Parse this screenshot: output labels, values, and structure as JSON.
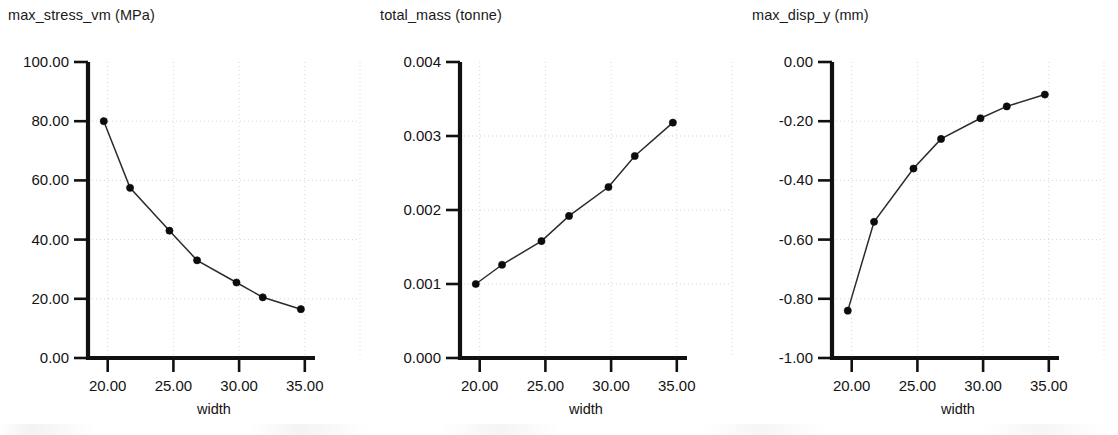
{
  "page": {
    "background_color": "#ffffff",
    "ink_color": "#111111",
    "grid_color": "#cfcfcf",
    "marker_color": "#0c0c0c",
    "panel_count": 3
  },
  "chart_data": [
    {
      "type": "line",
      "title": "max_stress_vm (MPa)",
      "xlabel": "width",
      "ylabel": "",
      "x": [
        19.7,
        21.7,
        24.7,
        26.8,
        29.8,
        31.8,
        34.7
      ],
      "values": [
        80.0,
        57.5,
        43.0,
        33.0,
        25.5,
        20.5,
        16.5
      ],
      "xlim": [
        18.5,
        35.7
      ],
      "ylim": [
        0.0,
        100.0
      ],
      "xticks": [
        20.0,
        25.0,
        30.0,
        35.0
      ],
      "xtick_labels": [
        "20.00",
        "25.00",
        "30.00",
        "35.00"
      ],
      "yticks": [
        0.0,
        20.0,
        40.0,
        60.0,
        80.0,
        100.0
      ],
      "ytick_labels": [
        "0.00",
        "20.00",
        "40.00",
        "60.00",
        "80.00",
        "100.00"
      ],
      "grid": true,
      "legend": "none",
      "markers": true
    },
    {
      "type": "line",
      "title": "total_mass (tonne)",
      "xlabel": "width",
      "ylabel": "",
      "x": [
        19.7,
        21.7,
        24.7,
        26.8,
        29.8,
        31.8,
        34.7
      ],
      "values": [
        0.001,
        0.00126,
        0.00158,
        0.00192,
        0.00231,
        0.00273,
        0.00318
      ],
      "xlim": [
        18.5,
        35.7
      ],
      "ylim": [
        0.0,
        0.004
      ],
      "xticks": [
        20.0,
        25.0,
        30.0,
        35.0
      ],
      "xtick_labels": [
        "20.00",
        "25.00",
        "30.00",
        "35.00"
      ],
      "yticks": [
        0.0,
        0.001,
        0.002,
        0.003,
        0.004
      ],
      "ytick_labels": [
        "0.000",
        "0.001",
        "0.002",
        "0.003",
        "0.004"
      ],
      "grid": true,
      "legend": "none",
      "markers": true
    },
    {
      "type": "line",
      "title": "max_disp_y (mm)",
      "xlabel": "width",
      "ylabel": "",
      "x": [
        19.7,
        21.7,
        24.7,
        26.8,
        29.8,
        31.8,
        34.7
      ],
      "values": [
        -0.84,
        -0.54,
        -0.36,
        -0.26,
        -0.19,
        -0.15,
        -0.11
      ],
      "xlim": [
        18.5,
        35.7
      ],
      "ylim": [
        -1.0,
        0.0
      ],
      "xticks": [
        20.0,
        25.0,
        30.0,
        35.0
      ],
      "xtick_labels": [
        "20.00",
        "25.00",
        "30.00",
        "35.00"
      ],
      "yticks": [
        -1.0,
        -0.8,
        -0.6,
        -0.4,
        -0.2,
        0.0
      ],
      "ytick_labels": [
        "-1.00",
        "-0.80",
        "-0.60",
        "-0.40",
        "-0.20",
        "0.00"
      ],
      "grid": true,
      "legend": "none",
      "markers": true
    }
  ]
}
